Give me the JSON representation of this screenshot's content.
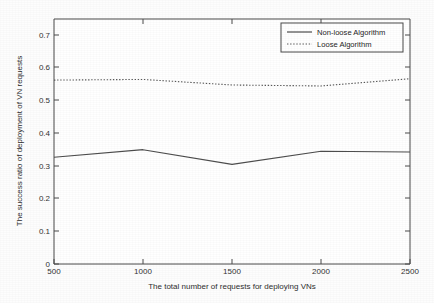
{
  "chart_data": {
    "type": "line",
    "title": "",
    "xlabel": "The total number of requests for deploying VNs",
    "ylabel": "The success ratio of deployment of VN requests",
    "x": [
      500,
      1000,
      1500,
      2000,
      2500
    ],
    "xlim": [
      500,
      2500
    ],
    "ylim": [
      0,
      0.75
    ],
    "xticks": [
      500,
      1000,
      1500,
      2000,
      2500
    ],
    "xtick_labels": [
      "500",
      "1000",
      "1500",
      "2000",
      "2500"
    ],
    "yticks": [
      0,
      0.1,
      0.2,
      0.3,
      0.4,
      0.5,
      0.6,
      0.7
    ],
    "ytick_labels": [
      "0",
      "0.1",
      "0.2",
      "0.3",
      "0.4",
      "0.5",
      "0.6",
      "0.7"
    ],
    "grid": false,
    "legend_position": "top-right",
    "series": [
      {
        "name": "Non-loose Algorithm",
        "style": "solid",
        "color": "#4d4d4d",
        "values": [
          0.327,
          0.35,
          0.305,
          0.345,
          0.343
        ]
      },
      {
        "name": "Loose Algorithm",
        "style": "dotted",
        "color": "#585858",
        "values": [
          0.563,
          0.565,
          0.548,
          0.545,
          0.567
        ]
      }
    ]
  },
  "legend": {
    "entries": [
      {
        "label": "Non-loose Algorithm",
        "marker": "solid-line-sample"
      },
      {
        "label": "Loose Algorithm",
        "marker": "dotted-line-sample"
      }
    ]
  },
  "axes": {
    "x_title": "The total number of requests for deploying VNs",
    "y_title": "The success ratio of deployment of VN requests",
    "x_tick_0": "500",
    "x_tick_1": "1000",
    "x_tick_2": "1500",
    "x_tick_3": "2000",
    "x_tick_4": "2500",
    "y_tick_0": "0",
    "y_tick_1": "0.1",
    "y_tick_2": "0.2",
    "y_tick_3": "0.3",
    "y_tick_4": "0.4",
    "y_tick_5": "0.5",
    "y_tick_6": "0.6",
    "y_tick_7": "0.7"
  },
  "colors": {
    "background": "#fdfdfd",
    "axis": "#4a4a4a",
    "series_solid": "#4d4d4d",
    "series_dotted": "#585858"
  }
}
